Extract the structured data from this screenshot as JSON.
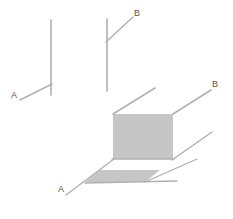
{
  "figure": {
    "background_color": "#ffffff",
    "canvas": {
      "width": 233,
      "height": 219
    },
    "colors": {
      "line_stroke": "#b0b0b0",
      "fill_gray": "#c6c6c6",
      "fill_white": "#ffffff",
      "label_text": "#555555"
    },
    "labels": [
      {
        "id": "left-a",
        "text": "A",
        "x": 14,
        "y": 96
      },
      {
        "id": "middle-b",
        "text": "B",
        "x": 137,
        "y": 14
      },
      {
        "id": "main-b",
        "text": "B",
        "x": 215,
        "y": 85
      },
      {
        "id": "main-a",
        "text": "A",
        "x": 61,
        "y": 190
      }
    ],
    "groups": [
      {
        "id": "left-figure",
        "name": "Two intersecting lines, label A",
        "segments": [
          {
            "id": "left-vertical",
            "x1": 51,
            "y1": 20,
            "x2": 51,
            "y2": 95
          },
          {
            "id": "left-diagonal-a",
            "x1": 20,
            "y1": 100,
            "x2": 52,
            "y2": 84
          }
        ]
      },
      {
        "id": "middle-figure",
        "name": "Two intersecting lines, label B",
        "segments": [
          {
            "id": "middle-vertical",
            "x1": 107,
            "y1": 19,
            "x2": 107,
            "y2": 91
          },
          {
            "id": "middle-diagonal-b",
            "x1": 106,
            "y1": 42,
            "x2": 133,
            "y2": 17
          }
        ]
      },
      {
        "id": "main-figure",
        "name": "Isometric plane with shaded faces, labels A and B",
        "faces": [
          {
            "id": "vertical-face",
            "fill": "#c6c6c6",
            "points": "113,114 173,114 173,159 113,159"
          },
          {
            "id": "floor-face-white",
            "fill": "#ffffff",
            "points": "113,159 173,159 144,180 84,180"
          },
          {
            "id": "floor-strip-gray",
            "fill": "#c6c6c6",
            "points": "99,171 159,171 144,182 84,182"
          }
        ],
        "segments": [
          {
            "id": "top-left-edge",
            "x1": 113,
            "y1": 114,
            "x2": 155,
            "y2": 88
          },
          {
            "id": "top-right-edge",
            "x1": 173,
            "y1": 114,
            "x2": 211,
            "y2": 90
          },
          {
            "id": "bottom-right-edge",
            "x1": 172,
            "y1": 160,
            "x2": 212,
            "y2": 132
          },
          {
            "id": "floor-front-edge",
            "x1": 66,
            "y1": 195,
            "x2": 177,
            "y2": 180
          },
          {
            "id": "floor-left-edge",
            "x1": 66,
            "y1": 195,
            "x2": 114,
            "y2": 159
          },
          {
            "id": "floor-top-edge",
            "x1": 113,
            "y1": 159,
            "x2": 174,
            "y2": 159
          },
          {
            "id": "floor-right-edge",
            "x1": 144,
            "y1": 181,
            "x2": 196,
            "y2": 159
          }
        ]
      }
    ]
  }
}
